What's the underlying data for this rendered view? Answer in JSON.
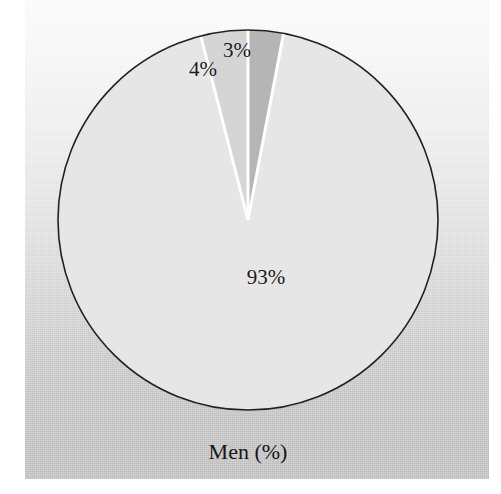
{
  "figure": {
    "caption": "Men (%)",
    "background_top_color": "#fdfdfd",
    "background_bottom_color": "#c0c0c0",
    "page_color": "#ffffff",
    "outline_color": "#222222"
  },
  "chart_data": {
    "type": "pie",
    "title": "Men (%)",
    "xlabel": "",
    "ylabel": "",
    "units": "%",
    "categories": [
      "3%",
      "93%",
      "4%"
    ],
    "values": [
      3,
      93,
      4
    ],
    "labels": [
      "3%",
      "93%",
      "4%"
    ],
    "colors": [
      "#b5b5b5",
      "#e6e6e6",
      "#d5d5d5"
    ],
    "legend": "none",
    "grid": false,
    "start_angle_deg": 0,
    "direction": "clockwise",
    "separator_color": "#ffffff",
    "slices": [
      {
        "label": "3%",
        "value": 3,
        "color": "#b5b5b5",
        "start_angle_deg": 0,
        "end_angle_deg": 10.8,
        "label_x": 237,
        "label_y": 50
      },
      {
        "label": "93%",
        "value": 93,
        "color": "#e6e6e6",
        "start_angle_deg": 10.8,
        "end_angle_deg": 345.6,
        "label_x": 266,
        "label_y": 277
      },
      {
        "label": "4%",
        "value": 4,
        "color": "#d5d5d5",
        "start_angle_deg": 345.6,
        "end_angle_deg": 360,
        "label_x": 203,
        "label_y": 69
      }
    ],
    "geometry": {
      "center_x": 248,
      "center_y": 220,
      "radius": 190
    }
  }
}
